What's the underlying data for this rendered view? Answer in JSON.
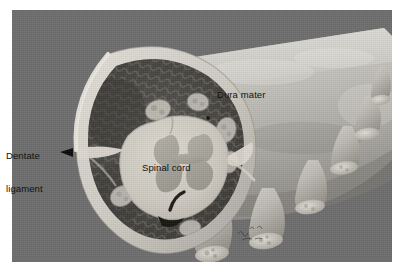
{
  "figure": {
    "panel_background": "#6e6e6e",
    "page_background": "#ffffff"
  },
  "labels": {
    "dura_mater": "Dura mater",
    "spinal_cord": "Spinal cord",
    "dentate_ligament_line1": "Dentate",
    "dentate_ligament_line2": "ligament"
  },
  "colors": {
    "background": "#6e6e6e",
    "dura_outer_light": "#c4c2bd",
    "dura_highlight": "#d8d6d0",
    "dura_shadow": "#8d8b86",
    "cut_rim": "#d6d3cb",
    "subarachnoid_dark": "#4a4845",
    "cord_pale": "#cfccc2",
    "gray_matter": "#a7a49b",
    "vessel_dark": "#1d1c1a",
    "nerve_root": "#bdbab2",
    "text": "#121212",
    "arrow": "#0a0a0a"
  },
  "structures": {
    "cylinder": "dural sac seen in oblique projection, cut open at left end",
    "cut_face": "elliptical cross-section at left showing cord, subarachnoid space and vessels",
    "spinal_cord": "pale oval with butterfly-shaped gray matter",
    "dentate_ligament": "pale band bridging cord to dura at mid-height",
    "nerve_roots": "six tapered root sleeves emerging along lower-right of dura",
    "signature": "artist signature, lower right of panel, illegible"
  }
}
